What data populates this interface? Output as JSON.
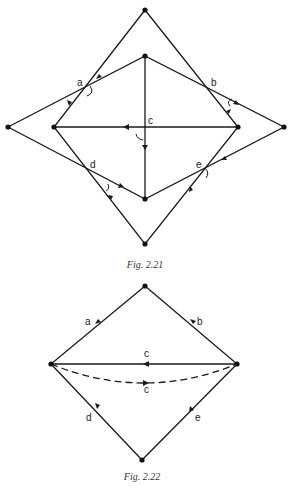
{
  "figures": [
    {
      "caption": "Fig. 2.21",
      "edge_labels": {
        "a": "a",
        "b": "b",
        "c": "c",
        "d": "d",
        "e": "e"
      },
      "vertices": {
        "outer_top": [
          145,
          10
        ],
        "inner_top": [
          145,
          56
        ],
        "outer_left": [
          8,
          127
        ],
        "inner_left": [
          54,
          127
        ],
        "inner_right": [
          238,
          127
        ],
        "outer_right": [
          284,
          127
        ],
        "inner_bottom": [
          145,
          199
        ],
        "outer_bottom": [
          145,
          244
        ]
      }
    },
    {
      "caption": "Fig. 2.22",
      "edge_labels": {
        "a": "a",
        "b": "b",
        "c_solid": "c",
        "c_dashed": "c",
        "d": "d",
        "e": "e"
      },
      "vertices": {
        "top": [
          145,
          286
        ],
        "left": [
          51,
          364
        ],
        "right": [
          237,
          364
        ],
        "bottom": [
          142,
          460
        ]
      }
    }
  ]
}
